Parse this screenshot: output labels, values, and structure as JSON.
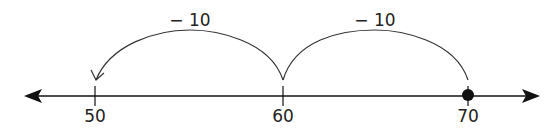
{
  "number_line": {
    "ticks": [
      {
        "value": "50",
        "x": 95
      },
      {
        "value": "60",
        "x": 283
      },
      {
        "value": "70",
        "x": 468
      }
    ],
    "start_point": {
      "value": "70",
      "filled": true
    },
    "axis_color": "#111111"
  },
  "jumps": [
    {
      "label": "− 10",
      "from": "70",
      "to": "60"
    },
    {
      "label": "− 10",
      "from": "60",
      "to": "50"
    }
  ]
}
